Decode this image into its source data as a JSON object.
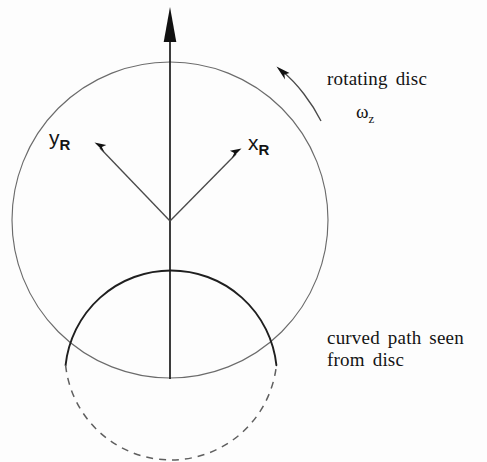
{
  "figure": {
    "background_color": "#fdfdfd",
    "stroke_color_thin": "#6b6b6b",
    "stroke_color_bold": "#1a1a1a",
    "text_color": "#141414"
  },
  "labels": {
    "rotating_disc": "rotating  disc",
    "angular_velocity_symbol": "ω",
    "angular_velocity_subscript": "z",
    "curved_path_line1": "curved  path  seen",
    "curved_path_line2": "from  disc",
    "x_axis_symbol": "x",
    "x_axis_subscript": "R",
    "y_axis_symbol": "y",
    "y_axis_subscript": "R"
  },
  "geometry": {
    "disc_circle": {
      "cx": 170,
      "cy": 220,
      "r": 158
    },
    "path_circle": {
      "cx": 171,
      "cy": 348,
      "r": 106
    },
    "z_axis": {
      "x": 170,
      "y_tip": 8,
      "y_base": 379
    },
    "x_axis_arrow": {
      "x1": 170,
      "y1": 221,
      "x2": 241,
      "y2": 149
    },
    "y_axis_arrow": {
      "x1": 170,
      "y1": 221,
      "x2": 95,
      "y2": 143
    },
    "rotation_arc": {
      "tip_x": 277,
      "tip_y": 66,
      "tail_x": 321,
      "tail_y": 121
    }
  }
}
